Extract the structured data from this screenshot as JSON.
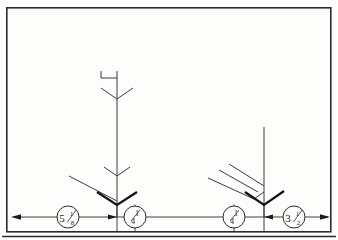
{
  "drawing": {
    "title": "Fabrication detail — dimensioned arrow assemblies",
    "sheet": {
      "width": 338,
      "height": 240
    },
    "background_color": "#fdfdfc",
    "line_color": "#2b2b2b",
    "heavy_line_color": "#111111",
    "border": {
      "name": "outer-frame",
      "x": 6,
      "y": 7,
      "width": 325,
      "height": 225,
      "stroke_width": 1.6,
      "second_rule_y": 236
    },
    "dimension_line": {
      "y": 217,
      "x_start": 10,
      "x_end": 331,
      "left_arrow": "left-arrowhead",
      "right_arrow": "right-arrowhead",
      "tick_positions": [
        117,
        224
      ]
    },
    "callouts": [
      {
        "name": "dimension-callout-left",
        "cx": 68,
        "cy": 217,
        "r": 11,
        "whole": "5",
        "numerator": "1",
        "denominator": "8"
      },
      {
        "name": "weld-callout-left",
        "cx": 135,
        "cy": 217,
        "r": 11,
        "whole": "",
        "numerator": "1",
        "denominator": "4"
      },
      {
        "name": "weld-callout-right",
        "cx": 234,
        "cy": 217,
        "r": 11,
        "whole": "",
        "numerator": "1",
        "denominator": "4"
      },
      {
        "name": "dimension-callout-right",
        "cx": 294,
        "cy": 217,
        "r": 11,
        "whole": "3",
        "numerator": "1",
        "denominator": "2"
      }
    ],
    "assembly_left": {
      "name": "left-arrow-assembly",
      "stem_x": 117,
      "stem_top": 71,
      "stem_bottom": 217,
      "top_bracket": {
        "x1": 101,
        "y1": 71,
        "x2": 117,
        "y2": 78
      },
      "chevrons": [
        {
          "y": 92,
          "half_width": 16,
          "drop": 7,
          "weight": "light"
        },
        {
          "y": 169,
          "half_width": 13,
          "drop": 7,
          "weight": "light"
        },
        {
          "y": 197,
          "half_width": 22,
          "drop": 10,
          "weight": "heavy"
        }
      ],
      "leader": {
        "x1": 69,
        "y1": 176,
        "x2": 117,
        "y2": 200
      }
    },
    "assembly_right": {
      "name": "right-arrow-assembly",
      "stem_x": 264,
      "stem_top": 127,
      "stem_bottom": 217,
      "chevrons": [
        {
          "y": 197,
          "half_width": 22,
          "drop": 10,
          "weight": "heavy"
        }
      ],
      "leaders": [
        {
          "x1": 229,
          "y1": 164,
          "x2": 264,
          "y2": 186
        },
        {
          "x1": 219,
          "y1": 172,
          "x2": 259,
          "y2": 192
        },
        {
          "x1": 209,
          "y1": 180,
          "x2": 256,
          "y2": 198
        }
      ]
    }
  }
}
